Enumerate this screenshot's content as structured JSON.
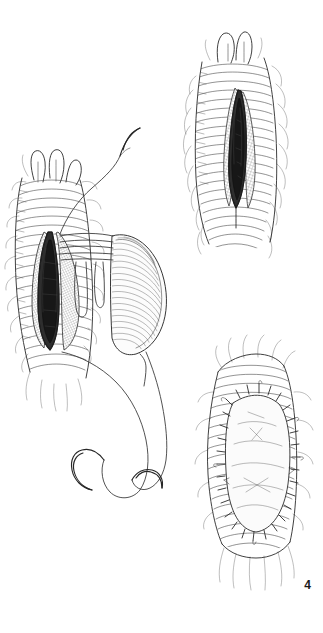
{
  "page": {
    "kind": "surgical-technique-illustration",
    "medium": "pen-and-ink line drawing",
    "background_color": "#ffffff",
    "ink_color": "#2b2b2b",
    "folio_number": "4",
    "folio_position": "bottom-right"
  },
  "figure": {
    "panel_count": 3,
    "caption": "",
    "panels": [
      {
        "id": "panel-left",
        "position": "left-middle",
        "name": "patch-graft-suturing-panel",
        "description": "Longitudinally incised trachea retracted open with dark lumen exposed; oval patch graft held to the right by a row of parallel traction sutures; long double-armed suture strands with curved needles trail below.",
        "elements": [
          "airway-segment",
          "cartilage-rings",
          "longitudinal-incision",
          "exposed-lumen",
          "patch-graft",
          "parallel-traction-sutures",
          "suture-loops",
          "suture-strand-upper",
          "curved-needle-upper",
          "suture-strand-lower-left",
          "curved-needle-lower-left",
          "suture-strand-lower-right",
          "curved-needle-lower-right"
        ]
      },
      {
        "id": "panel-top-right",
        "position": "top-right",
        "name": "incised-airway-panel",
        "description": "Anterior view of the airway with a narrow vertical full-thickness incision opened to reveal the dark lumen; ringed cartilage and frayed adventitial tissue surround the opening.",
        "elements": [
          "airway-segment",
          "cartilage-rings",
          "vertical-incision",
          "exposed-lumen",
          "frayed-adventitia",
          "bifurcation-tip"
        ]
      },
      {
        "id": "panel-bottom-right",
        "position": "bottom-right",
        "name": "completed-patch-panel",
        "description": "Completed repair: lens-shaped patch graft sewn into the airway defect with a continuous ring of interrupted sutures around its entire margin, widening the lumen.",
        "elements": [
          "airway-segment",
          "cartilage-rings",
          "inset-patch-graft",
          "interrupted-suture-line",
          "frayed-adventitia"
        ]
      }
    ]
  }
}
